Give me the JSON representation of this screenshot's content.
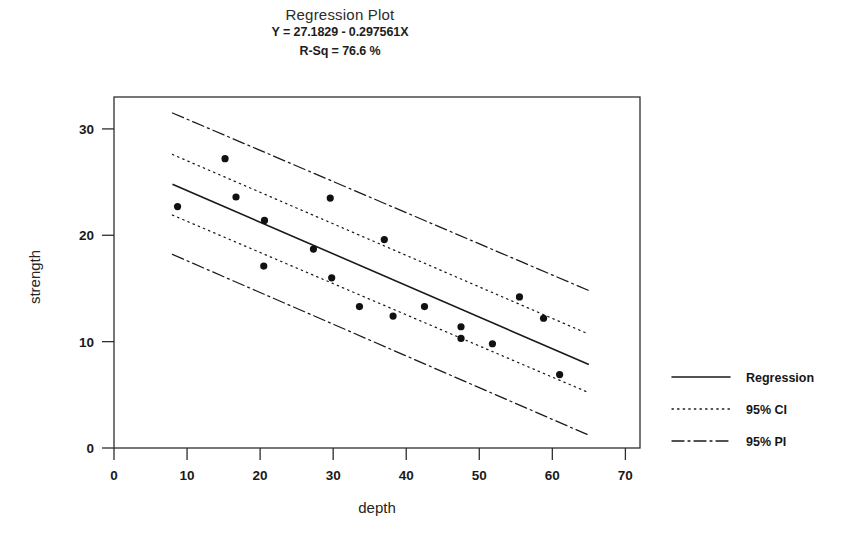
{
  "chart_data": {
    "type": "scatter",
    "title": "Regression Plot",
    "subtitle_equation": "Y = 27.1829 - 0.297561X",
    "subtitle_rsq": "R-Sq = 76.6 %",
    "xlabel": "depth",
    "ylabel": "strength",
    "xlim": [
      0,
      72
    ],
    "ylim": [
      0,
      33
    ],
    "xticks": [
      0,
      10,
      20,
      30,
      40,
      50,
      60,
      70
    ],
    "yticks": [
      0,
      10,
      20,
      30
    ],
    "xtick_labels": [
      "0",
      "10",
      "20",
      "30",
      "40",
      "50",
      "60",
      "70"
    ],
    "ytick_labels": [
      "0",
      "10",
      "20",
      "30"
    ],
    "grid": false,
    "legend_position": "right",
    "regression": {
      "intercept": 27.1829,
      "slope": -0.297561,
      "r_squared_percent": 76.6,
      "x_start": 8,
      "x_end": 65
    },
    "confidence_interval": {
      "level": 95,
      "label": "95% CI",
      "x_start": 8,
      "x_end": 65,
      "upper_start": 27.6,
      "upper_end": 10.7,
      "lower_start": 21.9,
      "lower_end": 5.2
    },
    "prediction_interval": {
      "level": 95,
      "label": "95% PI",
      "x_start": 8,
      "x_end": 65,
      "upper_start": 31.5,
      "upper_end": 14.8,
      "lower_start": 18.2,
      "lower_end": 1.2
    },
    "points": [
      {
        "x": 8.7,
        "y": 22.7
      },
      {
        "x": 15.2,
        "y": 27.2
      },
      {
        "x": 16.7,
        "y": 23.6
      },
      {
        "x": 20.6,
        "y": 21.4
      },
      {
        "x": 20.5,
        "y": 17.1
      },
      {
        "x": 27.3,
        "y": 18.7
      },
      {
        "x": 29.6,
        "y": 23.5
      },
      {
        "x": 29.8,
        "y": 16.0
      },
      {
        "x": 33.6,
        "y": 13.3
      },
      {
        "x": 37.0,
        "y": 19.6
      },
      {
        "x": 38.2,
        "y": 12.4
      },
      {
        "x": 42.5,
        "y": 13.3
      },
      {
        "x": 47.5,
        "y": 11.4
      },
      {
        "x": 47.5,
        "y": 10.3
      },
      {
        "x": 51.8,
        "y": 9.8
      },
      {
        "x": 55.5,
        "y": 14.2
      },
      {
        "x": 58.8,
        "y": 12.2
      },
      {
        "x": 61.0,
        "y": 6.9
      }
    ],
    "legend": [
      {
        "label": "Regression",
        "style": "solid"
      },
      {
        "label": "95% CI",
        "style": "dotted"
      },
      {
        "label": "95% PI",
        "style": "dashdot"
      }
    ],
    "colors": {
      "ink": "#1a1a1a",
      "frame": "#2e2e2e",
      "background": "#ffffff"
    }
  }
}
